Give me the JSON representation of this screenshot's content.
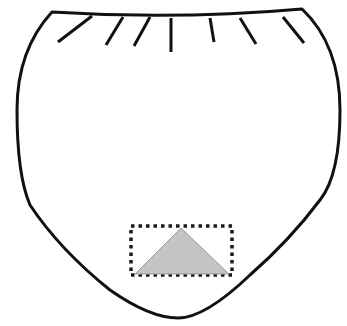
{
  "diagram": {
    "outline": {
      "stroke": "#111111",
      "fill": "#ffffff",
      "path": "M52,12 Q177,20 302,9 Q340,45 340,110 Q340,175 320,200 Q290,240 250,275 Q205,318 178,318 Q150,318 110,290 Q60,250 30,205 Q17,175 17,110 Q17,50 52,12 Z"
    },
    "fold_lines": [
      {
        "x1": 58,
        "y1": 42,
        "x2": 92,
        "y2": 16
      },
      {
        "x1": 106,
        "y1": 45,
        "x2": 123,
        "y2": 17
      },
      {
        "x1": 134,
        "y1": 46,
        "x2": 150,
        "y2": 17
      },
      {
        "x1": 171,
        "y1": 52,
        "x2": 171,
        "y2": 18
      },
      {
        "x1": 214,
        "y1": 42,
        "x2": 210,
        "y2": 18
      },
      {
        "x1": 256,
        "y1": 44,
        "x2": 240,
        "y2": 18
      },
      {
        "x1": 304,
        "y1": 43,
        "x2": 283,
        "y2": 17
      }
    ],
    "dotted_box": {
      "x": 131,
      "y": 226,
      "width": 101,
      "height": 49,
      "stroke": "#1a1a1a"
    },
    "triangle": {
      "points": "181,228 135,274 229,274",
      "fill": "#c4c4c4",
      "stroke": "#9a9a9a"
    }
  }
}
